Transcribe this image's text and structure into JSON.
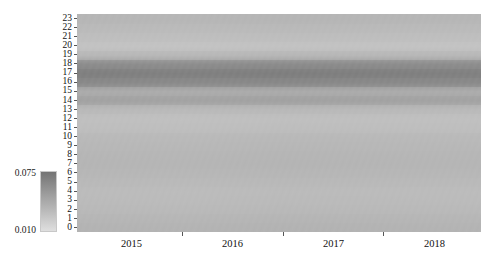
{
  "chart_data": {
    "type": "heatmap",
    "title": "",
    "xlabel": "",
    "ylabel": "",
    "x_tick_labels": [
      "2015",
      "2016",
      "2017",
      "2018"
    ],
    "x_tick_positions_frac": [
      0.135,
      0.385,
      0.635,
      0.885
    ],
    "x_boundary_positions_frac": [
      0.2599,
      0.5099,
      0.7574
    ],
    "y_tick_labels": [
      "23",
      "22",
      "21",
      "20",
      "19",
      "18",
      "17",
      "16",
      "15",
      "14",
      "13",
      "12",
      "11",
      "10",
      "9",
      "8",
      "7",
      "6",
      "5",
      "4",
      "3",
      "2",
      "1",
      "0"
    ],
    "y_values": [
      23,
      22,
      21,
      20,
      19,
      18,
      17,
      16,
      15,
      14,
      13,
      12,
      11,
      10,
      9,
      8,
      7,
      6,
      5,
      4,
      3,
      2,
      1,
      0
    ],
    "ylim": [
      0,
      23
    ],
    "grid": false,
    "colormap": "greys-reversed",
    "colorbar": {
      "label_high": "0.075",
      "label_low": "0.010",
      "vmin": 0.01,
      "vmax": 0.075,
      "position": "left-outside",
      "orientation": "vertical",
      "color_high": "#808080",
      "color_low": "#d9d9d9"
    },
    "row_values_by_hour": [
      {
        "hour": 0,
        "value": 0.0365
      },
      {
        "hour": 1,
        "value": 0.035
      },
      {
        "hour": 2,
        "value": 0.033
      },
      {
        "hour": 3,
        "value": 0.032
      },
      {
        "hour": 4,
        "value": 0.0315
      },
      {
        "hour": 5,
        "value": 0.033
      },
      {
        "hour": 6,
        "value": 0.0345
      },
      {
        "hour": 7,
        "value": 0.0355
      },
      {
        "hour": 8,
        "value": 0.035
      },
      {
        "hour": 9,
        "value": 0.034
      },
      {
        "hour": 10,
        "value": 0.033
      },
      {
        "hour": 11,
        "value": 0.03
      },
      {
        "hour": 12,
        "value": 0.029
      },
      {
        "hour": 13,
        "value": 0.033
      },
      {
        "hour": 14,
        "value": 0.047
      },
      {
        "hour": 15,
        "value": 0.041
      },
      {
        "hour": 16,
        "value": 0.062
      },
      {
        "hour": 17,
        "value": 0.068
      },
      {
        "hour": 18,
        "value": 0.06
      },
      {
        "hour": 19,
        "value": 0.034
      },
      {
        "hour": 20,
        "value": 0.027
      },
      {
        "hour": 21,
        "value": 0.03
      },
      {
        "hour": 22,
        "value": 0.0325
      },
      {
        "hour": 23,
        "value": 0.035
      }
    ],
    "column_modulation": [
      {
        "x_frac": 0.0,
        "factor": 1.0
      },
      {
        "x_frac": 0.26,
        "factor": 0.99
      },
      {
        "x_frac": 0.51,
        "factor": 1.01
      },
      {
        "x_frac": 0.76,
        "factor": 1.0
      },
      {
        "x_frac": 1.0,
        "factor": 0.99
      }
    ]
  }
}
